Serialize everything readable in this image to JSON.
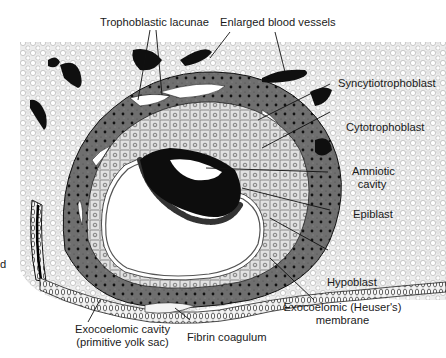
{
  "figure": {
    "colors": {
      "background": "#ffffff",
      "stroma": "#e6e6e6",
      "syncytiotrophoblast": "#6e6e6e",
      "cytotrophoblast": "#d6d6d6",
      "blood_vessel": "#111111",
      "lacuna": "#ffffff",
      "ink": "#1a1a1a"
    }
  },
  "labels": {
    "trophoblastic_lacunae": "Trophoblastic lacunae",
    "enlarged_blood_vessels": "Enlarged blood vessels",
    "syncytiotrophoblast": "Syncytiotrophoblast",
    "cytotrophoblast": "Cytotrophoblast",
    "amniotic_cavity_line1": "Amniotic",
    "amniotic_cavity_line2": "cavity",
    "epiblast": "Epiblast",
    "hypoblast": "Hypoblast",
    "exocoelomic_membrane_line1": "Exocoelomic (Heuser's)",
    "exocoelomic_membrane_line2": "membrane",
    "exocoelomic_cavity_line1": "Exocoelomic cavity",
    "exocoelomic_cavity_line2": "(primitive yolk sac)",
    "fibrin_coagulum": "Fibrin coagulum",
    "edge_mark": "d"
  }
}
